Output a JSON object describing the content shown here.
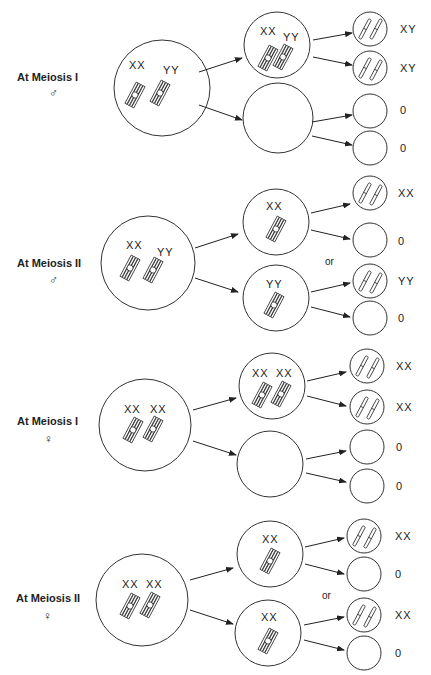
{
  "panels": [
    {
      "title": "At Meiosis I",
      "sex_symbol": "♂",
      "sex": "male",
      "parent": {
        "labels": [
          "XX",
          "YY"
        ]
      },
      "daughters": [
        {
          "labels": [
            "XX",
            "YY"
          ]
        },
        {
          "labels": []
        }
      ],
      "gametes": [
        "XY",
        "XY",
        "0",
        "0"
      ],
      "or_label": ""
    },
    {
      "title": "At Meiosis II",
      "sex_symbol": "♂",
      "sex": "male",
      "parent": {
        "labels": [
          "XX",
          "YY"
        ]
      },
      "daughters": [
        {
          "labels": [
            "XX"
          ]
        },
        {
          "labels": [
            "YY"
          ]
        }
      ],
      "gametes": [
        "XX",
        "0",
        "YY",
        "0"
      ],
      "or_label": "or"
    },
    {
      "title": "At Meiosis I",
      "sex_symbol": "♀",
      "sex": "female",
      "parent": {
        "labels": [
          "XX",
          "XX"
        ]
      },
      "daughters": [
        {
          "labels": [
            "XX",
            "XX"
          ]
        },
        {
          "labels": []
        }
      ],
      "gametes": [
        "XX",
        "XX",
        "0",
        "0"
      ],
      "or_label": ""
    },
    {
      "title": "At Meiosis II",
      "sex_symbol": "♀",
      "sex": "female",
      "parent": {
        "labels": [
          "XX",
          "XX"
        ]
      },
      "daughters": [
        {
          "labels": [
            "XX"
          ]
        },
        {
          "labels": [
            "XX"
          ]
        }
      ],
      "gametes": [
        "XX",
        "0",
        "XX",
        "0"
      ],
      "or_label": "or"
    }
  ]
}
